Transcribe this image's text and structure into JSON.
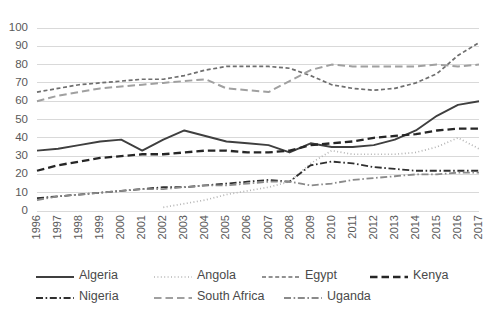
{
  "chart_data": {
    "type": "line",
    "title": "",
    "xlabel": "",
    "ylabel": "",
    "ylim": [
      0,
      100
    ],
    "ytick_step": 10,
    "grid": true,
    "legend_position": "bottom",
    "x": [
      1996,
      1997,
      1998,
      1999,
      2000,
      2001,
      2002,
      2003,
      2004,
      2005,
      2006,
      2007,
      2008,
      2009,
      2010,
      2011,
      2012,
      2013,
      2014,
      2015,
      2016,
      2017
    ],
    "yticks": [
      0,
      10,
      20,
      30,
      40,
      50,
      60,
      70,
      80,
      90,
      100
    ],
    "xticks": [
      "1996",
      "1997",
      "1998",
      "1999",
      "2000",
      "2001",
      "2002",
      "2003",
      "2004",
      "2005",
      "2006",
      "2007",
      "2008",
      "2009",
      "2010",
      "2011",
      "2012",
      "2013",
      "2014",
      "2015",
      "2016",
      "2017"
    ],
    "series": [
      {
        "name": "Algeria",
        "color": "#3f3f3f",
        "dash": "solid",
        "width": 1.9,
        "values": [
          33,
          34,
          36,
          38,
          39,
          33,
          39,
          44,
          41,
          38,
          37,
          36,
          32,
          37,
          35,
          35,
          36,
          39,
          44,
          52,
          58,
          60
        ]
      },
      {
        "name": "Angola",
        "color": "#b5b5b5",
        "dash": "dotted",
        "width": 1.7,
        "values": [
          null,
          null,
          null,
          null,
          null,
          null,
          2,
          4,
          6,
          9,
          11,
          13,
          16,
          26,
          33,
          31,
          31,
          31,
          32,
          35,
          40,
          34
        ]
      },
      {
        "name": "Egypt",
        "color": "#6e6e6e",
        "dash": "short-dash",
        "width": 1.7,
        "values": [
          65,
          67,
          69,
          70,
          71,
          72,
          72,
          74,
          77,
          79,
          79,
          79,
          78,
          74,
          69,
          67,
          66,
          67,
          70,
          75,
          85,
          92
        ]
      },
      {
        "name": "Kenya",
        "color": "#262626",
        "dash": "long-dash",
        "width": 2.3,
        "values": [
          22,
          25,
          27,
          29,
          30,
          31,
          31,
          32,
          33,
          33,
          32,
          32,
          33,
          36,
          37,
          38,
          40,
          41,
          42,
          44,
          45,
          45
        ]
      },
      {
        "name": "Nigeria",
        "color": "#2f2f2f",
        "dash": "dash-dot",
        "width": 1.8,
        "values": [
          7,
          8,
          9,
          10,
          11,
          12,
          13,
          13,
          14,
          15,
          16,
          17,
          16,
          25,
          27,
          26,
          24,
          23,
          22,
          22,
          22,
          22
        ]
      },
      {
        "name": "South Africa",
        "color": "#a0a0a0",
        "dash": "long-dash",
        "width": 2.0,
        "values": [
          60,
          63,
          65,
          67,
          68,
          69,
          70,
          71,
          72,
          67,
          66,
          65,
          71,
          77,
          80,
          79,
          79,
          79,
          79,
          80,
          79,
          80
        ]
      },
      {
        "name": "Uganda",
        "color": "#8a8a8a",
        "dash": "dash-dot",
        "width": 1.8,
        "values": [
          6,
          8,
          9,
          10,
          11,
          12,
          12,
          13,
          14,
          14,
          15,
          16,
          16,
          14,
          15,
          17,
          18,
          19,
          20,
          20,
          21,
          21
        ]
      }
    ]
  },
  "legend": {
    "items": [
      {
        "label": "Algeria"
      },
      {
        "label": "Angola"
      },
      {
        "label": "Egypt"
      },
      {
        "label": "Kenya"
      },
      {
        "label": "Nigeria"
      },
      {
        "label": "South Africa"
      },
      {
        "label": "Uganda"
      }
    ]
  }
}
